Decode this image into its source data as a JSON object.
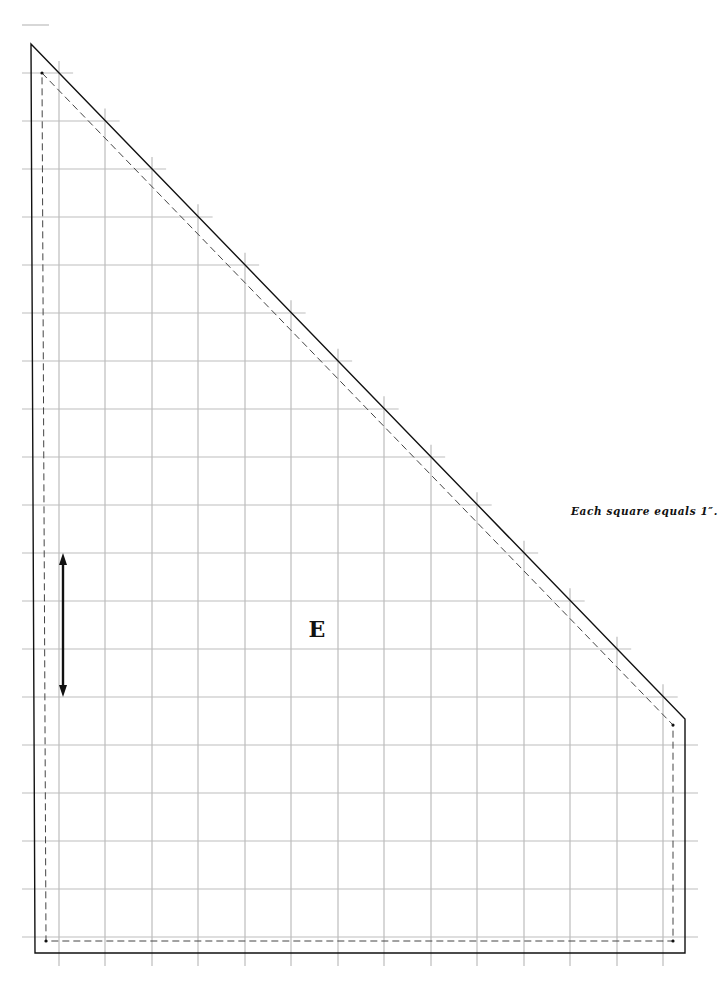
{
  "diagram": {
    "type": "sewing-pattern-piece",
    "piece_label": "E",
    "scale_note": "Each square equals 1″.",
    "grain_line": {
      "icon": "double-arrow-vertical-icon",
      "x": 63,
      "y_top": 553,
      "y_bottom": 697
    },
    "grid": {
      "unit": "1 inch per square",
      "vertical_lines_x": [
        59,
        105,
        152,
        198,
        245,
        291,
        338,
        384,
        431,
        477,
        524,
        570,
        617,
        663
      ],
      "horizontal_lines_y": [
        25,
        73,
        121,
        169,
        217,
        265,
        313,
        361,
        409,
        457,
        505,
        553,
        601,
        649,
        697,
        745,
        793,
        841,
        889,
        937
      ],
      "color": "#bdbdbd"
    },
    "cut_line": {
      "style": "solid",
      "color": "#111111",
      "points": [
        [
          31,
          44
        ],
        [
          685,
          719
        ],
        [
          685,
          953
        ],
        [
          35,
          953
        ]
      ]
    },
    "stitch_line": {
      "style": "dashed",
      "color": "#444444",
      "points": [
        [
          42,
          73
        ],
        [
          673,
          725
        ],
        [
          673,
          941
        ],
        [
          46,
          941
        ]
      ]
    }
  }
}
